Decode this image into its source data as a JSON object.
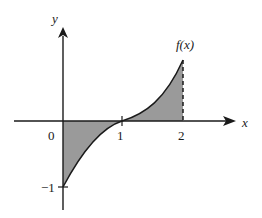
{
  "figure": {
    "axes": {
      "x_label": "x",
      "y_label": "y"
    },
    "ticks": {
      "x": [
        {
          "value": 0,
          "label": "0"
        },
        {
          "value": 1,
          "label": "1"
        },
        {
          "value": 2,
          "label": "2"
        }
      ],
      "y": [
        {
          "value": -1,
          "label": "−1"
        }
      ]
    },
    "curve_label": "f(x)",
    "shaded_regions": [
      {
        "from": 0,
        "to": 1,
        "side": "below x-axis"
      },
      {
        "from": 1,
        "to": 2,
        "side": "above x-axis"
      }
    ],
    "dashed_line": {
      "x": 2
    },
    "colors": {
      "axis": "#1a1a1a",
      "curve": "#1a1a1a",
      "fill": "#9a9a9a",
      "background": "#ffffff"
    }
  }
}
